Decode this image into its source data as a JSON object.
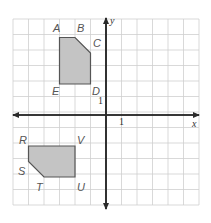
{
  "diagram": {
    "type": "coordinate-grid",
    "grid": {
      "cols": 12,
      "rows": 12,
      "x_min": -6,
      "x_max": 6,
      "y_min": -6,
      "y_max": 6,
      "origin_px": [
        106,
        115
      ],
      "cell_px": 15.5,
      "left_px": 13,
      "top_px": 19
    },
    "axes": {
      "x_label": "x",
      "y_label": "y",
      "x_tick_label": "1",
      "y_tick_label": "1"
    },
    "polygons": [
      {
        "name": "ABCDE",
        "fill": "#c4c4c4",
        "vertices": [
          {
            "label": "A",
            "x": -3,
            "y": 5
          },
          {
            "label": "B",
            "x": -2,
            "y": 5
          },
          {
            "label": "C",
            "x": -1,
            "y": 4
          },
          {
            "label": "D",
            "x": -1,
            "y": 2
          },
          {
            "label": "E",
            "x": -3,
            "y": 2
          }
        ]
      },
      {
        "name": "RSTUV",
        "fill": "#c4c4c4",
        "vertices": [
          {
            "label": "R",
            "x": -5,
            "y": -2
          },
          {
            "label": "S",
            "x": -5,
            "y": -3
          },
          {
            "label": "T",
            "x": -4,
            "y": -4
          },
          {
            "label": "U",
            "x": -2,
            "y": -4
          },
          {
            "label": "V",
            "x": -2,
            "y": -2
          }
        ]
      }
    ],
    "vertex_labels": {
      "A": "A",
      "B": "B",
      "C": "C",
      "D": "D",
      "E": "E",
      "R": "R",
      "S": "S",
      "T": "T",
      "U": "U",
      "V": "V"
    },
    "colors": {
      "grid": "#cfcfcf",
      "axis": "#2a2a2a",
      "shape_fill": "#c4c4c4",
      "shape_stroke": "#555555"
    }
  }
}
